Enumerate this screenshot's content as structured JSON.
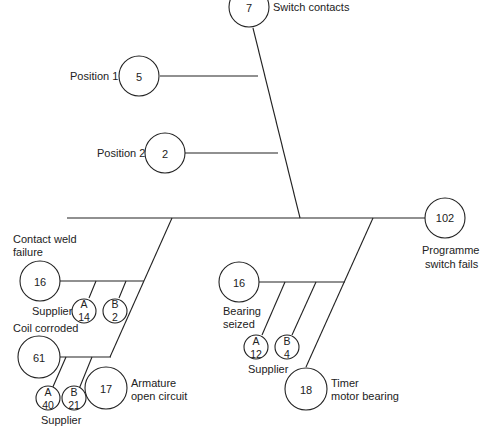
{
  "diagram": {
    "type": "fault-tree / fishbone",
    "top_event": {
      "value": "102",
      "label_line1": "Programme",
      "label_line2": "switch fails"
    },
    "branches": {
      "switch_contacts": {
        "value": "7",
        "label": "Switch contacts",
        "causes": [
          {
            "value": "5",
            "label": "Position 1"
          },
          {
            "value": "2",
            "label": "Position 2"
          }
        ]
      },
      "armature": {
        "value": "17",
        "label_line1": "Armature",
        "label_line2": "open circuit",
        "causes": [
          {
            "value": "16",
            "label_line1": "Contact weld",
            "label_line2": "failure",
            "supplier_label": "Supplier",
            "suppliers": [
              {
                "name": "A",
                "value": "14"
              },
              {
                "name": "B",
                "value": "2"
              }
            ]
          },
          {
            "value": "61",
            "label": "Coil corroded",
            "supplier_label": "Supplier",
            "suppliers": [
              {
                "name": "A",
                "value": "40"
              },
              {
                "name": "B",
                "value": "21"
              }
            ]
          }
        ]
      },
      "timer_motor": {
        "value": "18",
        "label_line1": "Timer",
        "label_line2": "motor bearing",
        "causes": [
          {
            "value": "16",
            "label_line1": "Bearing",
            "label_line2": "seized",
            "supplier_label": "Supplier",
            "suppliers": [
              {
                "name": "A",
                "value": "12"
              },
              {
                "name": "B",
                "value": "4"
              }
            ]
          }
        ]
      }
    }
  }
}
